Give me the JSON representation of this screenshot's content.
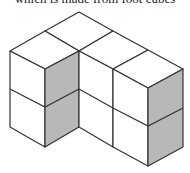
{
  "caption": "which is made from foot cubes",
  "figure": {
    "colors": {
      "stroke": "#333333",
      "top": "#ffffff",
      "front": "#ffffff",
      "shade": "#b8b8b8"
    },
    "faces": [
      {
        "name": "top-back",
        "fill": "top",
        "points": "79,12 113,31 79,51 45,31"
      },
      {
        "name": "top-left-column",
        "fill": "top",
        "points": "45,31 79,51 45,69 10,51"
      },
      {
        "name": "top-middle",
        "fill": "top",
        "points": "113,31 148,50 113,69 79,51"
      },
      {
        "name": "top-right-column",
        "fill": "top",
        "points": "148,50 183,69 148,88 113,69"
      },
      {
        "name": "left-column-front",
        "fill": "front",
        "points": "10,51 45,69 45,147 10,127"
      },
      {
        "name": "left-column-side-shaded",
        "fill": "shade",
        "points": "45,69 79,51 79,127 45,147"
      },
      {
        "name": "middle-front",
        "fill": "front",
        "points": "79,51 113,69 113,147 79,127"
      },
      {
        "name": "right-column-front",
        "fill": "front",
        "points": "113,69 148,88 148,166 113,147"
      },
      {
        "name": "right-column-side-shaded",
        "fill": "shade",
        "points": "148,88 183,69 183,147 148,166"
      }
    ],
    "edges": [
      "10,89 45,107 79,89",
      "79,89 113,108",
      "113,108 148,126 183,108"
    ]
  }
}
